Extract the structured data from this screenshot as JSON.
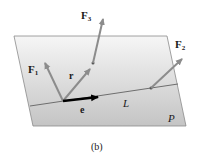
{
  "figure": {
    "caption": "(b)",
    "plane_label": "P",
    "line_label": "L",
    "vectors": {
      "F1": {
        "main": "F",
        "sub": "1"
      },
      "F2": {
        "main": "F",
        "sub": "2"
      },
      "F3": {
        "main": "F",
        "sub": "3"
      },
      "r": {
        "main": "r"
      },
      "e": {
        "main": "e"
      }
    },
    "colors": {
      "plane_top": "#f4f4f4",
      "plane_bottom": "#c8c8c8",
      "vector_gray": "#8c8c8c",
      "unit_vector": "#000000",
      "line": "#6e6e6e"
    }
  }
}
